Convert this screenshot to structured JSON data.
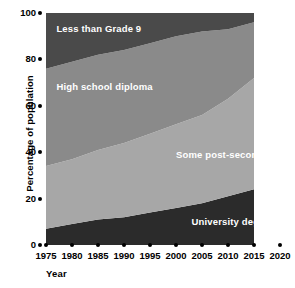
{
  "chart_data": {
    "type": "area",
    "title": "",
    "subtitle": "",
    "xlabel": "Year",
    "ylabel": "Percentage of population",
    "stacked": true,
    "normalized_to_100": true,
    "grid": false,
    "legend_position": "inline-labels",
    "xlim": [
      1975,
      2020
    ],
    "ylim": [
      0,
      100
    ],
    "plot_x_range": [
      1975,
      2015
    ],
    "x": [
      1975,
      1980,
      1985,
      1990,
      1995,
      2000,
      2005,
      2010,
      2015
    ],
    "xticks": [
      "1975",
      "1980",
      "1985",
      "1990",
      "1995",
      "2000",
      "2005",
      "2010",
      "2015",
      "2020"
    ],
    "xtick_values": [
      1975,
      1980,
      1985,
      1990,
      1995,
      2000,
      2005,
      2010,
      2015,
      2020
    ],
    "yticks": [
      "0",
      "20",
      "40",
      "60",
      "80",
      "100"
    ],
    "ytick_values": [
      0,
      20,
      40,
      60,
      80,
      100
    ],
    "series": [
      {
        "name": "University degree",
        "color": "#2b2b2b",
        "label_color": "#ffffff",
        "values": [
          7,
          9,
          11,
          12,
          14,
          16,
          18,
          21,
          24
        ]
      },
      {
        "name": "Some post-secondary",
        "color": "#a7a7a7",
        "label_color": "#ffffff",
        "values": [
          27,
          28,
          30,
          32,
          34,
          36,
          38,
          42,
          48
        ]
      },
      {
        "name": "High school diploma",
        "color": "#8a8a8a",
        "label_color": "#ffffff",
        "values": [
          42,
          42,
          41,
          40,
          39,
          38,
          36,
          30,
          24
        ]
      },
      {
        "name": "Less than Grade 9",
        "color": "#4a4a4a",
        "label_color": "#ffffff",
        "values": [
          24,
          21,
          18,
          16,
          13,
          10,
          8,
          7,
          4
        ]
      }
    ],
    "annotations": [
      {
        "text": "Less than Grade 9",
        "x": 1977,
        "y": 93
      },
      {
        "text": "High school diploma",
        "x": 1977,
        "y": 68
      },
      {
        "text": "Some post-secondary",
        "x": 2000,
        "y": 39
      },
      {
        "text": "University degree",
        "x": 2003,
        "y": 10
      }
    ]
  },
  "axes": {
    "x_title": "Year",
    "y_title": "Percentage of population"
  }
}
